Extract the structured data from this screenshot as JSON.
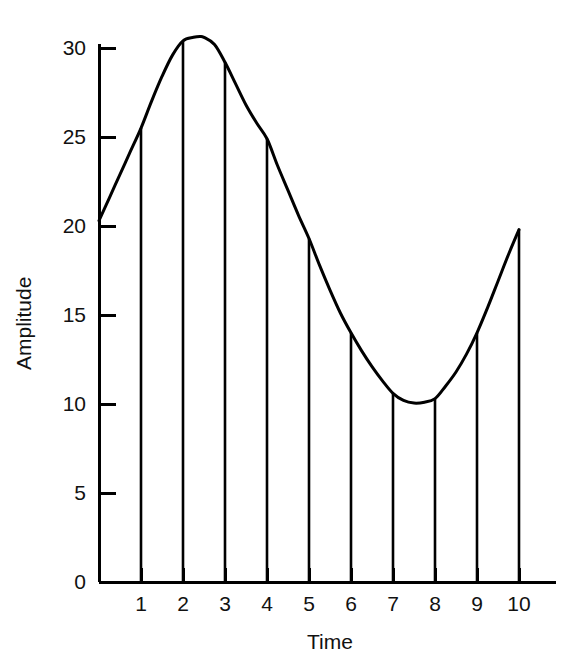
{
  "chart_data": {
    "type": "line",
    "title": "",
    "xlabel": "Time",
    "ylabel": "Amplitude",
    "xlim": [
      0,
      10.6
    ],
    "ylim": [
      0,
      31.5
    ],
    "grid": false,
    "legend": null,
    "xticks": [
      "1",
      "2",
      "3",
      "4",
      "5",
      "6",
      "7",
      "8",
      "9",
      "10"
    ],
    "xtick_values": [
      1,
      2,
      3,
      4,
      5,
      6,
      7,
      8,
      9,
      10
    ],
    "yticks": [
      "0",
      "5",
      "10",
      "15",
      "20",
      "25",
      "30"
    ],
    "ytick_values": [
      0,
      5,
      10,
      15,
      20,
      25,
      30
    ],
    "curve": {
      "name": "Continuous waveform",
      "x": [
        0.0,
        0.25,
        0.5,
        0.75,
        1.0,
        1.25,
        1.5,
        1.75,
        2.0,
        2.25,
        2.4,
        2.5,
        2.75,
        3.0,
        3.25,
        3.5,
        3.75,
        4.0,
        4.25,
        4.5,
        4.75,
        5.0,
        5.25,
        5.5,
        5.75,
        6.0,
        6.25,
        6.5,
        6.75,
        7.0,
        7.25,
        7.5,
        7.75,
        8.0,
        8.25,
        8.5,
        8.75,
        9.0,
        9.25,
        9.5,
        9.75,
        10.0
      ],
      "y": [
        20.3,
        21.6,
        22.9,
        24.2,
        25.5,
        27.0,
        28.4,
        29.6,
        30.4,
        30.6,
        30.65,
        30.6,
        30.2,
        29.2,
        28.0,
        26.8,
        25.8,
        24.9,
        23.4,
        22.0,
        20.6,
        19.3,
        17.8,
        16.4,
        15.1,
        14.0,
        13.0,
        12.1,
        11.3,
        10.6,
        10.2,
        10.05,
        10.1,
        10.3,
        11.0,
        11.8,
        12.8,
        14.0,
        15.4,
        16.9,
        18.4,
        19.8
      ]
    },
    "samples": {
      "name": "Sampled impulses",
      "x": [
        1,
        2,
        3,
        4,
        5,
        6,
        7,
        8,
        9,
        10
      ],
      "y": [
        25.5,
        30.4,
        29.2,
        24.9,
        19.3,
        14.0,
        10.6,
        10.3,
        14.0,
        19.8
      ]
    },
    "colors": {
      "curve": "#000000",
      "samples": "#000000",
      "axis": "#000000",
      "background": "#ffffff"
    }
  }
}
